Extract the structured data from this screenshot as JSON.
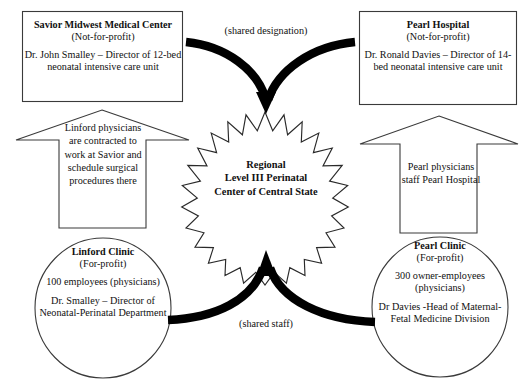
{
  "diagram": {
    "stroke_color": "#1a1a1a",
    "fill_color": "#ffffff",
    "arrow_color": "#000000"
  },
  "nodes": {
    "savior_hospital": {
      "name": "Savior Midwest Medical Center",
      "status": "(Not-for-profit)",
      "detail": "Dr. John Smalley – Director of 12-bed neonatal intensive care unit",
      "shape": "rectangle"
    },
    "pearl_hospital": {
      "name": "Pearl Hospital",
      "status": "(Not-for-profit)",
      "detail": "Dr. Ronald Davies – Director of 14-bed neonatal intensive care unit",
      "shape": "rectangle"
    },
    "linford_clinic": {
      "name": "Linford Clinic",
      "status": "(For-profit)",
      "employees": "100 employees (physicians)",
      "detail": "Dr. Smalley – Director of Neonatal-Perinatal Department",
      "shape": "ellipse"
    },
    "pearl_clinic": {
      "name": "Pearl Clinic",
      "status": "(For-profit)",
      "employees": "300 owner-employees (physicians)",
      "detail": "Dr Davies -Head of Maternal-Fetal Medicine Division",
      "shape": "ellipse"
    },
    "center": {
      "line1": "Regional",
      "line2": "Level III Perinatal",
      "line3": "Center of Central State",
      "shape": "starburst"
    }
  },
  "connectors": {
    "block_arrow_left": {
      "text": "Linford physicians are contracted to work at Savior and schedule surgical procedures there",
      "direction": "up",
      "from": "linford_clinic",
      "to": "savior_hospital"
    },
    "block_arrow_right": {
      "text": "Pearl physicians staff Pearl Hospital",
      "direction": "up",
      "from": "pearl_clinic",
      "to": "pearl_hospital"
    },
    "curve_top": {
      "label": "(shared designation)",
      "from": "savior_hospital and pearl_hospital",
      "to": "center"
    },
    "curve_bottom": {
      "label": "(shared staff)",
      "from": "linford_clinic and pearl_clinic",
      "to": "center"
    }
  }
}
